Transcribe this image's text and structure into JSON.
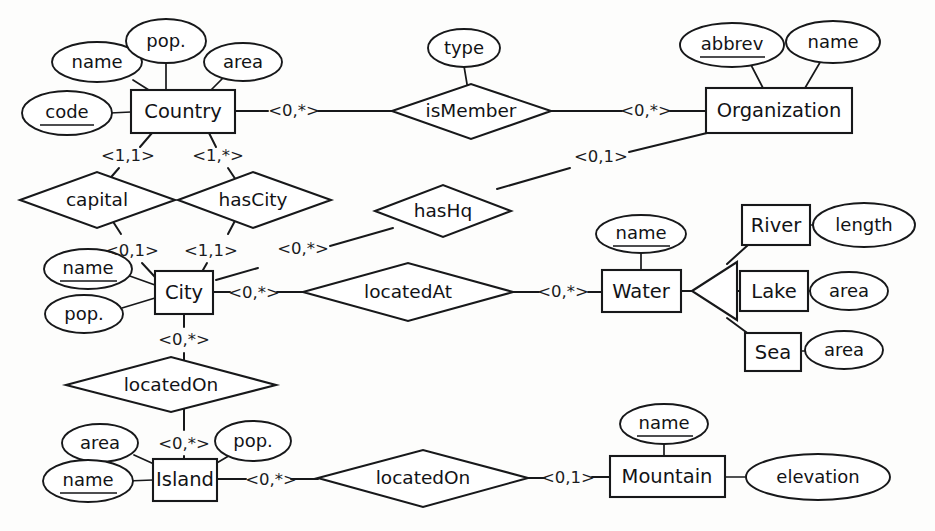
{
  "diagram": {
    "notation": "min-max cardinality ER notation",
    "entities": [
      {
        "id": "country",
        "label": "Country",
        "x": 182,
        "y": 111
      },
      {
        "id": "organization",
        "label": "Organization",
        "x": 779,
        "y": 110
      },
      {
        "id": "city",
        "label": "City",
        "x": 184,
        "y": 292
      },
      {
        "id": "water",
        "label": "Water",
        "x": 641,
        "y": 291
      },
      {
        "id": "river",
        "label": "River",
        "x": 776,
        "y": 225
      },
      {
        "id": "lake",
        "label": "Lake",
        "x": 774,
        "y": 291
      },
      {
        "id": "sea",
        "label": "Sea",
        "x": 772,
        "y": 352
      },
      {
        "id": "island",
        "label": "Island",
        "x": 184,
        "y": 479
      },
      {
        "id": "mountain",
        "label": "Mountain",
        "x": 667,
        "y": 475
      }
    ],
    "relationships": [
      {
        "id": "ismember",
        "label": "isMember",
        "x": 471,
        "y": 111
      },
      {
        "id": "capital",
        "label": "capital",
        "x": 97,
        "y": 200
      },
      {
        "id": "hascity",
        "label": "hasCity",
        "x": 253,
        "y": 200
      },
      {
        "id": "hashq",
        "label": "hasHq",
        "x": 443,
        "y": 211
      },
      {
        "id": "locatedat",
        "label": "locatedAt",
        "x": 408,
        "y": 292
      },
      {
        "id": "locatedon-city-island",
        "label": "locatedOn",
        "x": 171,
        "y": 385
      },
      {
        "id": "locatedon-island-mountain",
        "label": "locatedOn",
        "x": 423,
        "y": 478
      }
    ],
    "attributes": [
      {
        "id": "country-name",
        "label": "name",
        "key": false,
        "owner": "country",
        "x": 97,
        "y": 62
      },
      {
        "id": "country-pop",
        "label": "pop.",
        "key": false,
        "owner": "country",
        "x": 166,
        "y": 41
      },
      {
        "id": "country-area",
        "label": "area",
        "key": false,
        "owner": "country",
        "x": 243,
        "y": 62
      },
      {
        "id": "country-code",
        "label": "code",
        "key": true,
        "owner": "country",
        "x": 67,
        "y": 113
      },
      {
        "id": "ismember-type",
        "label": "type",
        "key": false,
        "owner": "ismember",
        "x": 464,
        "y": 48
      },
      {
        "id": "org-abbrev",
        "label": "abbrev",
        "key": true,
        "owner": "organization",
        "x": 732,
        "y": 45
      },
      {
        "id": "org-name",
        "label": "name",
        "key": false,
        "owner": "organization",
        "x": 833,
        "y": 42
      },
      {
        "id": "city-name",
        "label": "name",
        "key": true,
        "owner": "city",
        "x": 88,
        "y": 269
      },
      {
        "id": "city-pop",
        "label": "pop.",
        "key": false,
        "owner": "city",
        "x": 84,
        "y": 314
      },
      {
        "id": "water-name",
        "label": "name",
        "key": true,
        "owner": "water",
        "x": 641,
        "y": 234
      },
      {
        "id": "river-length",
        "label": "length",
        "key": false,
        "owner": "river",
        "x": 864,
        "y": 225
      },
      {
        "id": "lake-area",
        "label": "area",
        "key": false,
        "owner": "lake",
        "x": 849,
        "y": 291
      },
      {
        "id": "sea-area",
        "label": "area",
        "key": false,
        "owner": "sea",
        "x": 844,
        "y": 350
      },
      {
        "id": "island-area",
        "label": "area",
        "key": false,
        "owner": "island",
        "x": 100,
        "y": 443
      },
      {
        "id": "island-pop",
        "label": "pop.",
        "key": false,
        "owner": "island",
        "x": 253,
        "y": 441
      },
      {
        "id": "island-name",
        "label": "name",
        "key": true,
        "owner": "island",
        "x": 88,
        "y": 481
      },
      {
        "id": "mountain-name",
        "label": "name",
        "key": true,
        "owner": "mountain",
        "x": 664,
        "y": 424
      },
      {
        "id": "mountain-elev",
        "label": "elevation",
        "key": false,
        "owner": "mountain",
        "x": 818,
        "y": 477
      }
    ],
    "cardinalities": [
      {
        "id": "card-country-ismember",
        "label": "<0,*>",
        "x": 294,
        "y": 111
      },
      {
        "id": "card-org-ismember",
        "label": "<0,*>",
        "x": 646,
        "y": 111
      },
      {
        "id": "card-country-capital",
        "label": "<1,1>",
        "x": 128,
        "y": 156
      },
      {
        "id": "card-country-hascity",
        "label": "<1,*>",
        "x": 218,
        "y": 156
      },
      {
        "id": "card-org-hashq",
        "label": "<0,1>",
        "x": 601,
        "y": 157
      },
      {
        "id": "card-city-capital",
        "label": "<0,1>",
        "x": 132,
        "y": 251
      },
      {
        "id": "card-city-hascity",
        "label": "<1,1>",
        "x": 211,
        "y": 251
      },
      {
        "id": "card-city-hashq",
        "label": "<0,*>",
        "x": 303,
        "y": 249
      },
      {
        "id": "card-city-locatedat",
        "label": "<0,*>",
        "x": 254,
        "y": 293
      },
      {
        "id": "card-water-locatedat",
        "label": "<0,*>",
        "x": 563,
        "y": 292
      },
      {
        "id": "card-city-locatedon",
        "label": "<0,*>",
        "x": 184,
        "y": 340
      },
      {
        "id": "card-island-locatedon",
        "label": "<0,*>",
        "x": 184,
        "y": 444
      },
      {
        "id": "card-island-locatedon2",
        "label": "<0,*>",
        "x": 271,
        "y": 480
      },
      {
        "id": "card-mountain-locatedon",
        "label": "<0,1>",
        "x": 568,
        "y": 478
      }
    ],
    "isa": {
      "id": "water-isa",
      "supertype": "Water",
      "subtypes": [
        "River",
        "Lake",
        "Sea"
      ]
    },
    "colors": {
      "stroke": "#17181a",
      "fill": "#ffffff",
      "background": "#fdfdfc",
      "text": "#121316"
    }
  }
}
